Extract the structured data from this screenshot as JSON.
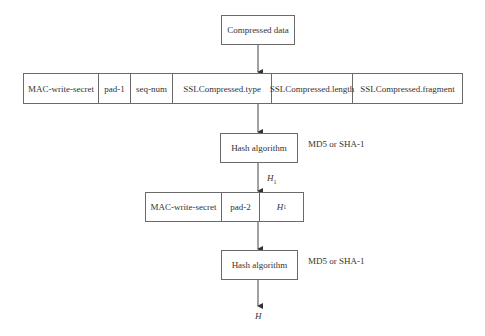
{
  "diagram": {
    "input_box": {
      "label": "Compressed data"
    },
    "row1": {
      "fields": [
        {
          "label": "MAC-write-secret",
          "width": 75
        },
        {
          "label": "pad-1",
          "width": 32
        },
        {
          "label": "seq-num",
          "width": 42
        },
        {
          "label": "SSLCompressed.type",
          "width": 99
        },
        {
          "label": "SSLCompressed.length",
          "width": 81
        },
        {
          "label": "SSLCompressed.fragment",
          "width": 110
        }
      ]
    },
    "hash1": {
      "label": "Hash algorithm",
      "annotation": "MD5 or SHA-1"
    },
    "h1_label": {
      "text": "H",
      "sub": "1"
    },
    "row2": {
      "fields": [
        {
          "label": "MAC-write-secret",
          "width": 76
        },
        {
          "label": "pad-2",
          "width": 38
        },
        {
          "label": "H",
          "sub": "1",
          "width": 44
        }
      ]
    },
    "hash2": {
      "label": "Hash algorithm",
      "annotation": "MD5 or SHA-1"
    },
    "output_label": {
      "text": "H"
    }
  }
}
